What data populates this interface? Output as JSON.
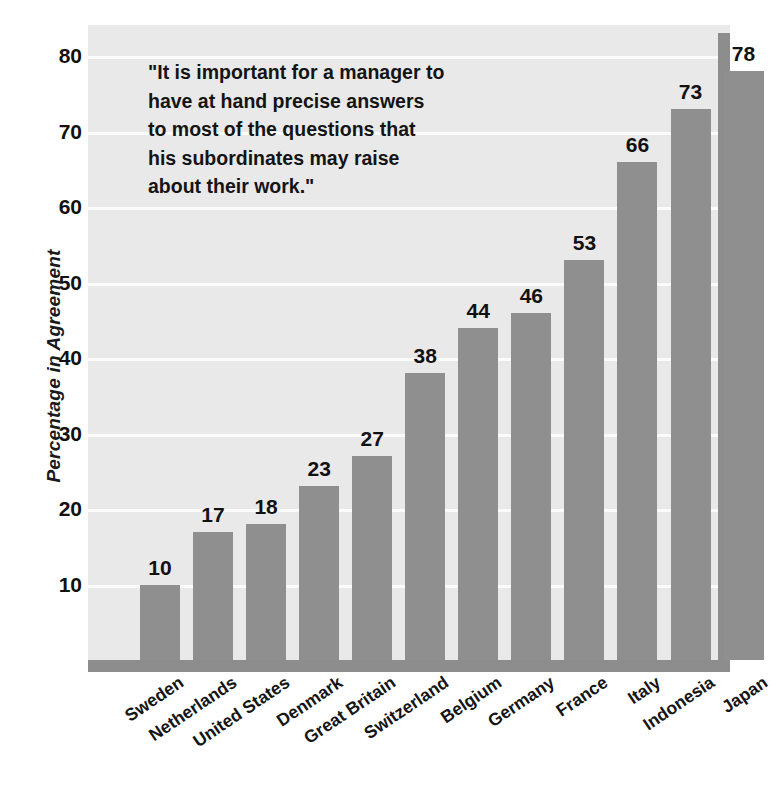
{
  "chart_data": {
    "type": "bar",
    "title": "",
    "subtitle": "",
    "xlabel": "",
    "ylabel": "Percentage in Agreement",
    "ylim": [
      0,
      85
    ],
    "yticks": [
      10,
      20,
      30,
      40,
      50,
      60,
      70,
      80
    ],
    "ytick_labels": [
      "10",
      "20",
      "30",
      "40",
      "50",
      "60",
      "70",
      "80"
    ],
    "grid": true,
    "legend": false,
    "categories": [
      "Sweden",
      "Netherlands",
      "United States",
      "Denmark",
      "Great Britain",
      "Switzerland",
      "Belgium",
      "Germany",
      "France",
      "Italy",
      "Indonesia",
      "Japan"
    ],
    "values": [
      10,
      17,
      18,
      23,
      27,
      38,
      44,
      46,
      53,
      66,
      73,
      78
    ],
    "value_labels": [
      "10",
      "17",
      "18",
      "23",
      "27",
      "38",
      "44",
      "46",
      "53",
      "66",
      "73",
      "78"
    ],
    "annotation": {
      "lines": [
        "\"It is important for a manager to",
        "have at hand precise answers",
        "to most of the questions that",
        "his subordinates may raise",
        "about their work.\""
      ]
    },
    "colors": {
      "bar": "#8f8f8f",
      "plot_background": "#e9e9e9",
      "gridline": "#fbfbfb",
      "axis_frame": "#8d8d8d",
      "text": "#111111",
      "page_background": "#ffffff"
    }
  }
}
